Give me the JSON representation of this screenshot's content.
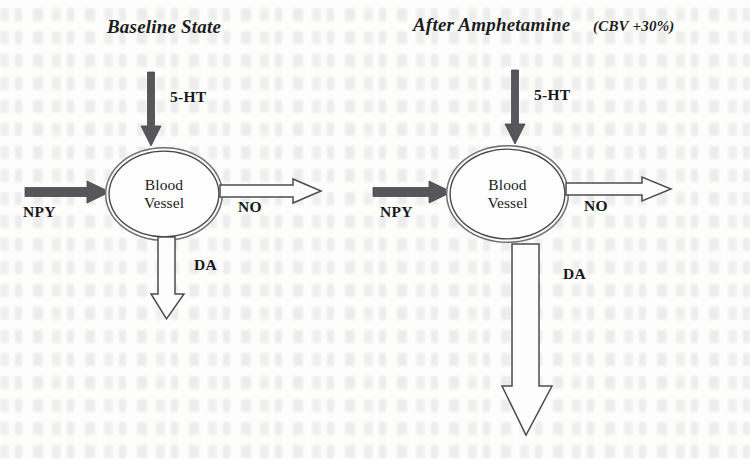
{
  "figure": {
    "background_color": "#fdfdfc",
    "ink_color": "#1b1b1d",
    "solid_arrow_color": "#58565a",
    "hollow_arrow_color": "#fdfdfd",
    "vessel_outline_color": "#4a484c"
  },
  "panels": [
    {
      "id": "baseline",
      "title_main": "Baseline State",
      "title_sub": "",
      "vessel_label_line1": "Blood",
      "vessel_label_line2": "Vessel",
      "arrows": [
        {
          "name": "5-HT",
          "label": "5-HT",
          "style": "solid",
          "direction": "down",
          "magnitude": "normal"
        },
        {
          "name": "NPY",
          "label": "NPY",
          "style": "solid",
          "direction": "right",
          "magnitude": "normal"
        },
        {
          "name": "NO",
          "label": "NO",
          "style": "hollow",
          "direction": "right",
          "magnitude": "normal"
        },
        {
          "name": "DA",
          "label": "DA",
          "style": "hollow",
          "direction": "down",
          "magnitude": "normal"
        }
      ]
    },
    {
      "id": "after-amphetamine",
      "title_main": "After Amphetamine",
      "title_sub": "(CBV +30%)",
      "vessel_label_line1": "Blood",
      "vessel_label_line2": "Vessel",
      "arrows": [
        {
          "name": "5-HT",
          "label": "5-HT",
          "style": "solid",
          "direction": "down",
          "magnitude": "normal"
        },
        {
          "name": "NPY",
          "label": "NPY",
          "style": "solid",
          "direction": "right",
          "magnitude": "normal"
        },
        {
          "name": "NO",
          "label": "NO",
          "style": "hollow",
          "direction": "right",
          "magnitude": "normal"
        },
        {
          "name": "DA",
          "label": "DA",
          "style": "hollow",
          "direction": "down",
          "magnitude": "greatly-increased"
        }
      ]
    }
  ]
}
